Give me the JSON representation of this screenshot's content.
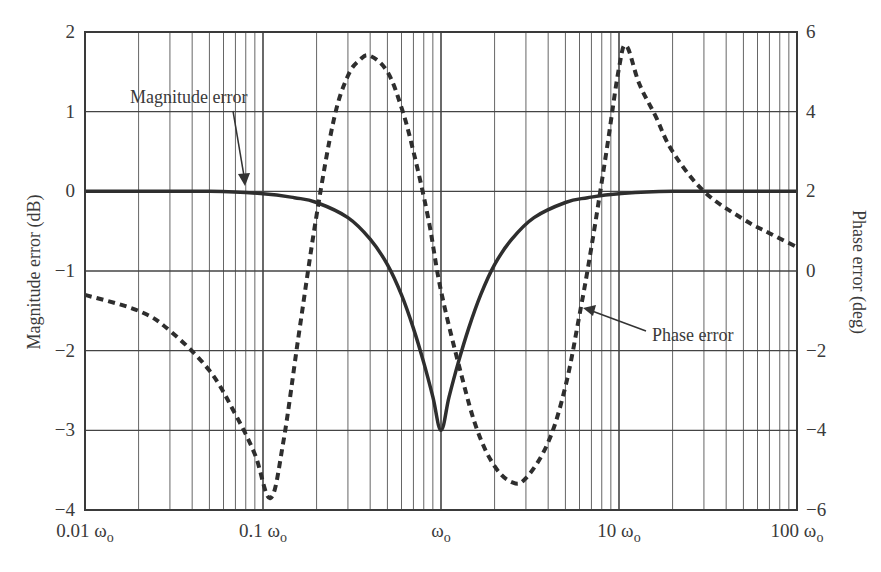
{
  "chart_data": {
    "type": "line",
    "title": "",
    "xlabel": "",
    "ylabel": "Magnitude error (dB)",
    "y2label": "Phase error (deg)",
    "xscale": "log",
    "x_ticks": [
      "0.01 ωo",
      "0.1 ωo",
      "ωo",
      "10 ωo",
      "100 ωo"
    ],
    "x_tick_values": [
      0.01,
      0.1,
      1,
      10,
      100
    ],
    "xlim": [
      0.01,
      100
    ],
    "ylim": [
      -4,
      2
    ],
    "y_ticks": [
      "2",
      "1",
      "0",
      "−1",
      "−2",
      "−3",
      "−4"
    ],
    "y2lim": [
      -6,
      6
    ],
    "y2_ticks": [
      "6",
      "4",
      "2",
      "0",
      "−2",
      "−4",
      "−6"
    ],
    "grid": true,
    "legend": "annotations",
    "annotations": [
      {
        "text": "Magnitude error",
        "points_to": [
          0.085,
          0.0
        ]
      },
      {
        "text": "Phase error",
        "points_to": [
          6.5,
          -1.0
        ]
      }
    ],
    "series": [
      {
        "name": "Magnitude error",
        "axis": "left",
        "style": "solid",
        "x": [
          0.01,
          0.05,
          0.1,
          0.15,
          0.2,
          0.3,
          0.4,
          0.5,
          0.6,
          0.7,
          0.8,
          0.9,
          1.0,
          1.11,
          1.25,
          1.43,
          1.67,
          2.0,
          2.5,
          3.33,
          5.0,
          6.67,
          10,
          20,
          100
        ],
        "values": [
          0.0,
          0.0,
          -0.03,
          -0.08,
          -0.14,
          -0.33,
          -0.6,
          -0.92,
          -1.3,
          -1.72,
          -2.15,
          -2.58,
          -3.0,
          -2.58,
          -2.15,
          -1.72,
          -1.3,
          -0.92,
          -0.6,
          -0.33,
          -0.14,
          -0.08,
          -0.03,
          0.0,
          0.0
        ]
      },
      {
        "name": "Phase error",
        "axis": "right",
        "style": "dashed",
        "x": [
          0.01,
          0.02,
          0.03,
          0.05,
          0.07,
          0.09,
          0.11,
          0.13,
          0.16,
          0.2,
          0.25,
          0.3,
          0.35,
          0.4,
          0.5,
          0.6,
          0.7,
          0.85,
          1.0,
          1.3,
          1.6,
          2.0,
          2.5,
          3.0,
          4.0,
          5.0,
          6.0,
          7.0,
          8.5,
          10,
          11,
          13,
          16,
          20,
          30,
          50,
          70,
          100
        ],
        "values": [
          -0.6,
          -1.0,
          -1.5,
          -2.5,
          -3.6,
          -4.6,
          -5.7,
          -4.3,
          -1.5,
          1.4,
          3.8,
          4.9,
          5.3,
          5.4,
          5.0,
          4.1,
          3.0,
          1.3,
          -0.5,
          -2.6,
          -4.0,
          -4.9,
          -5.3,
          -5.2,
          -4.3,
          -2.9,
          -1.1,
          0.6,
          3.0,
          5.1,
          5.65,
          4.7,
          3.9,
          3.0,
          2.0,
          1.3,
          0.95,
          0.6
        ]
      }
    ]
  }
}
